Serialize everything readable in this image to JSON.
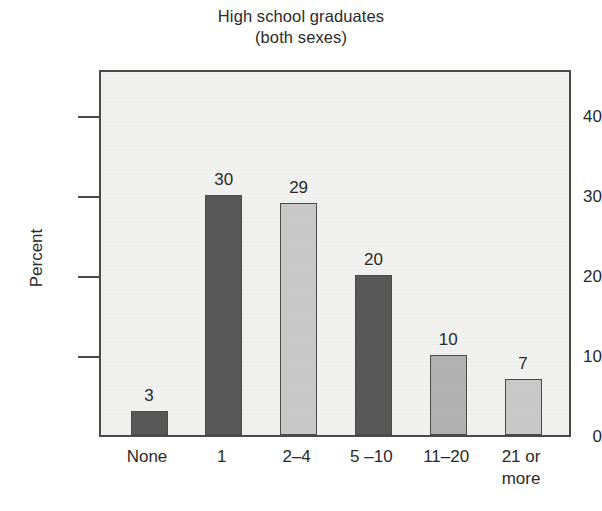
{
  "chart_data": {
    "type": "bar",
    "title": "High school graduates",
    "subtitle": "(both sexes)",
    "xlabel": "",
    "ylabel": "Percent",
    "categories": [
      "None",
      "1",
      "2–4",
      "5 –10",
      "11–20",
      "21 or\nmore"
    ],
    "values": [
      3,
      30,
      29,
      20,
      10,
      7
    ],
    "value_labels": [
      "3",
      "30",
      "29",
      "20",
      "10",
      "7"
    ],
    "ylim": [
      0,
      46
    ],
    "yticks": [
      0,
      10,
      20,
      30,
      40
    ],
    "ytick_labels": [
      "0",
      "10",
      "20",
      "30",
      "40"
    ],
    "grid": false,
    "legend": "none",
    "bar_colors": [
      "#585858",
      "#585858",
      "#c9c9c9",
      "#585858",
      "#b2b2b2",
      "#c9c9c9"
    ],
    "bar_border_color": "#4a4a4a",
    "plot_background": "#f1f1ef",
    "axis_color": "#4a4a4a",
    "text_color": "#2a2a2a"
  }
}
